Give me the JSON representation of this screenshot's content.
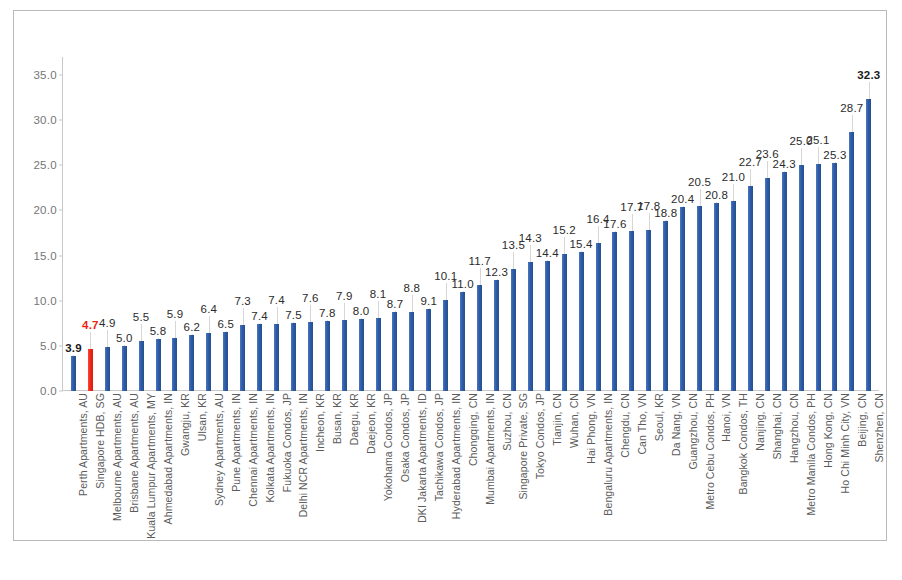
{
  "chart_data": {
    "type": "bar",
    "title": "",
    "subtitle": "",
    "xlabel": "",
    "ylabel": "",
    "ylim": [
      0.0,
      37.0
    ],
    "yticks": [
      "0.0",
      "5.0",
      "10.0",
      "15.0",
      "20.0",
      "25.0",
      "30.0",
      "35.0"
    ],
    "ytick_values": [
      0.0,
      5.0,
      10.0,
      15.0,
      20.0,
      25.0,
      30.0,
      35.0
    ],
    "grid": false,
    "legend": "none",
    "highlight_category": "Singapore HDB, SG",
    "highlight_color": "#F3271B",
    "bar_color": "#2F5CA8",
    "categories": [
      "Perth Apartments, AU",
      "Singapore HDB, SG",
      "Melbourne Apartments, AU",
      "Brisbane Apartments, AU",
      "Kuala Lumpur Apartments, MY",
      "Ahmedabad Apartments, IN",
      "Gwangju, KR",
      "Ulsan, KR",
      "Sydney Apartments, AU",
      "Pune Apartments, IN",
      "Chennai Apartments, IN",
      "Kolkata Apartments, IN",
      "Fukuoka Condos, JP",
      "Delhi NCR Apartments, IN",
      "Incheon, KR",
      "Busan, KR",
      "Daegu, KR",
      "Daejeon, KR",
      "Yokohama Condos, JP",
      "Osaka Condos, JP",
      "DKI Jakarta Apartments, ID",
      "Tachikawa Condos, JP",
      "Hyderabad Apartments, IN",
      "Chongqing, CN",
      "Mumbai Apartments, IN",
      "Suzhou, CN",
      "Singapore Private, SG",
      "Tokyo Condos, JP",
      "Tianjin, CN",
      "Wuhan, CN",
      "Hai Phong, VN",
      "Bengaluru Apartments, IN",
      "Chengdu, CN",
      "Can Tho, VN",
      "Seoul, KR",
      "Da Nang, VN",
      "Guangzhou, CN",
      "Metro Cebu Condos, PH",
      "Hanoi, VN",
      "Bangkok Condos, TH",
      "Nanjing, CN",
      "Shanghai, CN",
      "Hangzhou, CN",
      "Metro Manila Condos, PH",
      "Hong Kong, CN",
      "Ho Chi Minh City, VN",
      "Beijing, CN",
      "Shenzhen, CN"
    ],
    "values": [
      3.9,
      4.7,
      4.9,
      5.0,
      5.5,
      5.8,
      5.9,
      6.2,
      6.4,
      6.5,
      7.3,
      7.4,
      7.4,
      7.5,
      7.6,
      7.8,
      7.9,
      8.0,
      8.1,
      8.7,
      8.8,
      9.1,
      10.1,
      11.0,
      11.7,
      12.3,
      13.5,
      14.3,
      14.4,
      15.2,
      15.4,
      16.4,
      17.6,
      17.7,
      17.8,
      18.8,
      20.4,
      20.5,
      20.8,
      21.0,
      22.7,
      23.6,
      24.3,
      25.0,
      25.1,
      25.3,
      28.7,
      32.3
    ],
    "value_labels": [
      "3.9",
      "4.7",
      "4.9",
      "5.0",
      "5.5",
      "5.8",
      "5.9",
      "6.2",
      "6.4",
      "6.5",
      "7.3",
      "7.4",
      "7.4",
      "7.5",
      "7.6",
      "7.8",
      "7.9",
      "8.0",
      "8.1",
      "8.7",
      "8.8",
      "9.1",
      "10.1",
      "11.0",
      "11.7",
      "12.3",
      "13.5",
      "14.3",
      "14.4",
      "15.2",
      "15.4",
      "16.4",
      "17.6",
      "17.7",
      "17.8",
      "18.8",
      "20.4",
      "20.5",
      "20.8",
      "21.0",
      "22.7",
      "23.6",
      "24.3",
      "25.0",
      "25.1",
      "25.3",
      "28.7",
      "32.3"
    ],
    "label_emphasis": [
      "bold",
      "red",
      "normal",
      "normal",
      "normal",
      "normal",
      "normal",
      "normal",
      "normal",
      "normal",
      "normal",
      "normal",
      "normal",
      "normal",
      "normal",
      "normal",
      "normal",
      "normal",
      "normal",
      "normal",
      "normal",
      "normal",
      "normal",
      "normal",
      "normal",
      "normal",
      "normal",
      "normal",
      "normal",
      "normal",
      "normal",
      "normal",
      "normal",
      "normal",
      "normal",
      "normal",
      "normal",
      "normal",
      "normal",
      "normal",
      "normal",
      "normal",
      "normal",
      "normal",
      "normal",
      "normal",
      "normal",
      "bold"
    ],
    "label_tier": [
      1,
      2,
      2,
      1,
      2,
      1,
      2,
      1,
      2,
      1,
      2,
      1,
      2,
      1,
      2,
      1,
      2,
      1,
      2,
      1,
      2,
      1,
      2,
      1,
      2,
      1,
      2,
      2,
      1,
      2,
      1,
      2,
      1,
      2,
      2,
      1,
      1,
      2,
      1,
      2,
      2,
      2,
      1,
      2,
      2,
      1,
      2,
      2
    ]
  }
}
